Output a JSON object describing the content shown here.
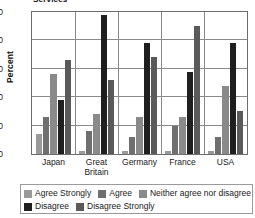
{
  "title_clipped": "Services",
  "axis": {
    "ylabel": "Percent",
    "yticks": [
      "50",
      "40",
      "30",
      "20",
      "10",
      "0"
    ],
    "ymin": 0,
    "ymax": 50
  },
  "legend": {
    "items": [
      {
        "label": "Agree Strongly",
        "color": "#9a9a9a"
      },
      {
        "label": "Agree",
        "color": "#6f6f6f"
      },
      {
        "label": "Neither agree nor disagree",
        "color": "#8a8a8a"
      },
      {
        "label": "Disagree",
        "color": "#1f1f1f"
      },
      {
        "label": "Disagree Strongly",
        "color": "#5a5a5a"
      }
    ]
  },
  "chart_data": {
    "type": "bar",
    "title": "Services",
    "xlabel": "",
    "ylabel": "Percent",
    "ylim": [
      0,
      50
    ],
    "ytick_step": 10,
    "grid": true,
    "legend_position": "bottom",
    "categories": [
      "Japan",
      "Great Britain",
      "Germany",
      "France",
      "USA"
    ],
    "series": [
      {
        "name": "Agree Strongly",
        "color": "#9a9a9a",
        "values": [
          7,
          1,
          1,
          1,
          1
        ]
      },
      {
        "name": "Agree",
        "color": "#6f6f6f",
        "values": [
          13,
          8,
          6,
          10,
          6
        ]
      },
      {
        "name": "Neither agree nor disagree",
        "color": "#8a8a8a",
        "values": [
          28,
          14,
          13,
          13,
          24
        ]
      },
      {
        "name": "Disagree",
        "color": "#1f1f1f",
        "values": [
          19,
          49,
          39,
          29,
          39
        ]
      },
      {
        "name": "Disagree Strongly",
        "color": "#5a5a5a",
        "values": [
          33,
          26,
          34,
          45,
          15
        ]
      }
    ]
  }
}
